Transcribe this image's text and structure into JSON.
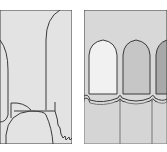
{
  "figure": {
    "panels": [
      {
        "id": "left",
        "description": "tooth outline cross-section with root and gum line",
        "fill": "#e3e3e3",
        "stroke": "#3a3a3a"
      },
      {
        "id": "right",
        "description": "three teeth with graded shades",
        "fill": "#d8d8d8",
        "stroke": "#3a3a3a",
        "teeth_colors": [
          "#f1f1f1",
          "#c6c6c6",
          "#a9a9a9"
        ]
      }
    ]
  }
}
